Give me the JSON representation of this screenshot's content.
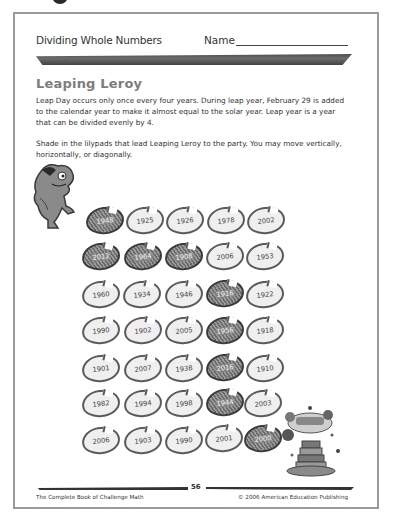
{
  "header": {
    "subject": "Dividing Whole Numbers",
    "name_label": "Name"
  },
  "title": "Leaping Leroy",
  "paragraphs": [
    "Leap Day occurs only once every four years. During leap year, February 29 is added to the calendar year to make it almost equal to the solar year. Leap year is a year that can be divided evenly by 4.",
    "Shade in the lilypads that lead Leaping Leroy to the party. You may move vertically, horizontally, or diagonally."
  ],
  "lilypads": {
    "rows": [
      [
        {
          "year": "1948",
          "shaded": true
        },
        {
          "year": "1925",
          "shaded": false
        },
        {
          "year": "1926",
          "shaded": false
        },
        {
          "year": "1978",
          "shaded": false
        },
        {
          "year": "2002",
          "shaded": false
        }
      ],
      [
        {
          "year": "2012",
          "shaded": true
        },
        {
          "year": "1964",
          "shaded": true
        },
        {
          "year": "1908",
          "shaded": true
        },
        {
          "year": "2006",
          "shaded": false
        },
        {
          "year": "1953",
          "shaded": false
        }
      ],
      [
        {
          "year": "1960",
          "shaded": false
        },
        {
          "year": "1934",
          "shaded": false
        },
        {
          "year": "1946",
          "shaded": false
        },
        {
          "year": "1916",
          "shaded": true
        },
        {
          "year": "1922",
          "shaded": false
        }
      ],
      [
        {
          "year": "1990",
          "shaded": false
        },
        {
          "year": "1902",
          "shaded": false
        },
        {
          "year": "2005",
          "shaded": false
        },
        {
          "year": "1956",
          "shaded": true
        },
        {
          "year": "1918",
          "shaded": false
        }
      ],
      [
        {
          "year": "1901",
          "shaded": false
        },
        {
          "year": "2007",
          "shaded": false
        },
        {
          "year": "1938",
          "shaded": false
        },
        {
          "year": "2016",
          "shaded": true
        },
        {
          "year": "1910",
          "shaded": false
        }
      ],
      [
        {
          "year": "1982",
          "shaded": false
        },
        {
          "year": "1994",
          "shaded": false
        },
        {
          "year": "1998",
          "shaded": false
        },
        {
          "year": "1944",
          "shaded": true
        },
        {
          "year": "2003",
          "shaded": false
        }
      ],
      [
        {
          "year": "2006",
          "shaded": false
        },
        {
          "year": "1903",
          "shaded": false
        },
        {
          "year": "1990",
          "shaded": false
        },
        {
          "year": "2001",
          "shaded": false
        },
        {
          "year": "2000",
          "shaded": true
        }
      ]
    ]
  },
  "illustrations": {
    "start": "frog-icon",
    "end": "birthday-cake-icon"
  },
  "footer": {
    "page_number": "56",
    "book_title": "The Complete Book of Challenge Math",
    "copyright": "© 2006 American Education Publishing"
  }
}
